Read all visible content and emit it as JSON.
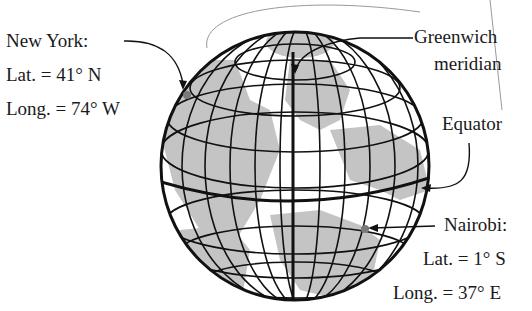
{
  "labels": {
    "new_york": {
      "name": "New York:",
      "lat": "Lat. = 41° N",
      "long": "Long. = 74° W"
    },
    "greenwich": {
      "line1": "Greenwich",
      "line2": "meridian"
    },
    "equator": "Equator",
    "nairobi": {
      "name": "Nairobi:",
      "lat": "Lat. = 1° S",
      "long": "Long. = 37° E"
    }
  },
  "colors": {
    "land": "#c4c4c4",
    "ocean": "#ffffff",
    "grid": "#111111",
    "dot": "#7a7a7a"
  }
}
